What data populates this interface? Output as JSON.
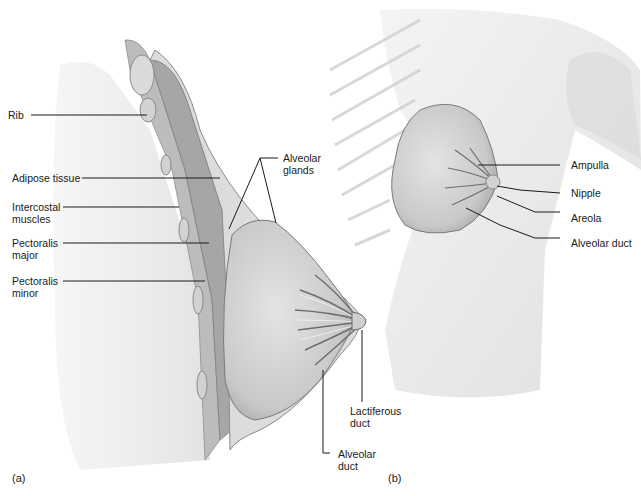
{
  "figure": {
    "panels": [
      {
        "id": "a",
        "label": "(a)"
      },
      {
        "id": "b",
        "label": "(b)"
      }
    ]
  },
  "panel_a": {
    "labels": {
      "rib": [
        "Rib"
      ],
      "adipose": [
        "Adipose tissue"
      ],
      "intercostal": [
        "Intercostal",
        "muscles"
      ],
      "pect_major": [
        "Pectoralis",
        "major"
      ],
      "pect_minor": [
        "Pectoralis",
        "minor"
      ],
      "alveolar_glands": [
        "Alveolar",
        "glands"
      ],
      "lactiferous": [
        "Lactiferous",
        "duct"
      ],
      "alveolar_duct": [
        "Alveolar",
        "duct"
      ]
    }
  },
  "panel_b": {
    "labels": {
      "ampulla": "Ampulla",
      "nipple": "Nipple",
      "areola": "Areola",
      "alveolar_duct": "Alveolar duct"
    }
  },
  "colors": {
    "tissue_light": "#e9e9e9",
    "tissue_mid": "#c8c8c8",
    "tissue_dark": "#8a8a8a",
    "line": "#1a1a1a"
  }
}
